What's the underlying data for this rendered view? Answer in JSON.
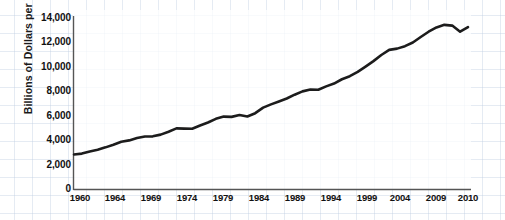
{
  "chart_data": {
    "type": "line",
    "title": "",
    "xlabel": "",
    "ylabel": "Billions of Dollars per Year",
    "xlim": [
      1960,
      2010
    ],
    "ylim": [
      0,
      14000
    ],
    "grid": true,
    "legend": "none",
    "line_color": "#1c1c1c",
    "grid_color": "#bfcfe3",
    "axis_color": "#555555",
    "xticks": [
      "1960",
      "1964",
      "1969",
      "1974",
      "1979",
      "1984",
      "1989",
      "1994",
      "1999",
      "2004",
      "2009",
      "2010"
    ],
    "yticks": [
      "0",
      "2,000",
      "4,000",
      "6,000",
      "8,000",
      "10,000",
      "12,000",
      "14,000"
    ],
    "series": [
      {
        "name": "Real GDP",
        "x": [
          1960,
          1961,
          1962,
          1963,
          1964,
          1965,
          1966,
          1967,
          1968,
          1969,
          1970,
          1971,
          1972,
          1973,
          1974,
          1975,
          1976,
          1977,
          1978,
          1979,
          1980,
          1981,
          1982,
          1983,
          1984,
          1985,
          1986,
          1987,
          1988,
          1989,
          1990,
          1991,
          1992,
          1993,
          1994,
          1995,
          1996,
          1997,
          1998,
          1999,
          2000,
          2001,
          2002,
          2003,
          2004,
          2005,
          2006,
          2007,
          2008,
          2009,
          2010
        ],
        "values": [
          2860,
          2930,
          3110,
          3250,
          3440,
          3660,
          3900,
          4010,
          4200,
          4330,
          4340,
          4480,
          4720,
          4990,
          4970,
          4960,
          5230,
          5470,
          5770,
          5950,
          5930,
          6080,
          5960,
          6230,
          6680,
          6950,
          7190,
          7430,
          7740,
          8010,
          8160,
          8140,
          8420,
          8650,
          9000,
          9250,
          9600,
          10030,
          10480,
          10980,
          11400,
          11500,
          11700,
          12000,
          12450,
          12880,
          13230,
          13440,
          13380,
          12880,
          13250
        ]
      }
    ],
    "annotations": {
      "source": "SOURCE: Economic Report of the President (Washington, D.C.: U.S. Government Printing Office, various years)."
    }
  }
}
